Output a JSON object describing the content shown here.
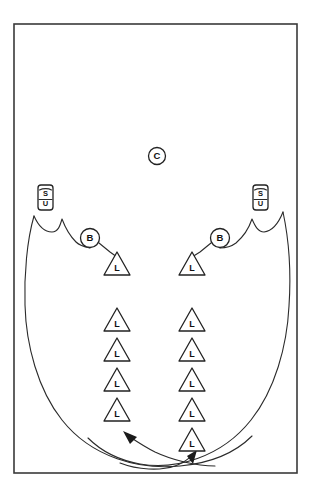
{
  "diagram": {
    "frame": {
      "x": 14,
      "y": 24,
      "width": 283,
      "height": 449,
      "color": "#3a3a3a"
    },
    "line_color": "#2b2b2b",
    "shape_fill": "#ffffff",
    "shape_stroke": "#222222"
  },
  "markers": {
    "center": {
      "label": "C",
      "x": 157,
      "y": 156,
      "r": 9
    },
    "supply_units": [
      {
        "label_top": "S",
        "label_bottom": "U",
        "x": 45,
        "y": 197,
        "side": "left"
      },
      {
        "label_top": "S",
        "label_bottom": "U",
        "x": 260,
        "y": 197,
        "side": "right"
      }
    ],
    "b_nodes": [
      {
        "label": "B",
        "x": 90,
        "y": 238,
        "r": 10,
        "side": "left"
      },
      {
        "label": "B",
        "x": 220,
        "y": 238,
        "r": 10,
        "side": "right"
      }
    ],
    "left_column": [
      {
        "label": "L",
        "x": 117,
        "y": 264
      },
      {
        "label": "L",
        "x": 117,
        "y": 320
      },
      {
        "label": "L",
        "x": 117,
        "y": 350
      },
      {
        "label": "L",
        "x": 117,
        "y": 380
      },
      {
        "label": "L",
        "x": 117,
        "y": 410
      }
    ],
    "right_column": [
      {
        "label": "L",
        "x": 192,
        "y": 264
      },
      {
        "label": "L",
        "x": 192,
        "y": 320
      },
      {
        "label": "L",
        "x": 192,
        "y": 350
      },
      {
        "label": "L",
        "x": 192,
        "y": 380
      },
      {
        "label": "L",
        "x": 192,
        "y": 410
      },
      {
        "label": "L",
        "x": 192,
        "y": 440
      }
    ]
  },
  "counts": {
    "left_triangles": 5,
    "right_triangles": 6,
    "b_circles": 2,
    "supply_units": 2,
    "center_circles": 1,
    "arrows": 2
  },
  "arrows": [
    {
      "name": "left-sweep-arrow",
      "direction": "up-left",
      "tip_x": 125,
      "tip_y": 433
    },
    {
      "name": "right-sweep-arrow",
      "direction": "up-right",
      "tip_x": 191,
      "tip_y": 452
    }
  ]
}
